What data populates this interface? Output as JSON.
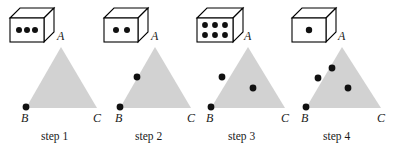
{
  "figure": {
    "background_color": "#ffffff",
    "triangle_fill": "#d2d2d2",
    "dot_color": "#111111",
    "die_face_color": "#ffffff",
    "die_outline_color": "#000000",
    "label_color": "#1a1a1a",
    "width": 398,
    "height": 149
  },
  "panels": [
    {
      "id": "step-1",
      "step_label": "step 1",
      "die": {
        "name": "die-three",
        "pips": 3,
        "pip_layout": "row-3"
      },
      "triangle": {
        "apex_label": "A",
        "left_label": "B",
        "right_label": "C",
        "apex": [
          61,
          47
        ],
        "left": [
          26,
          108
        ],
        "right": [
          97,
          108
        ]
      },
      "points": [
        {
          "name": "point-B",
          "x": 26,
          "y": 107
        }
      ]
    },
    {
      "id": "step-2",
      "step_label": "step 2",
      "die": {
        "name": "die-two",
        "pips": 2,
        "pip_layout": "row-2"
      },
      "triangle": {
        "apex_label": "A",
        "left_label": "B",
        "right_label": "C",
        "apex": [
          155,
          47
        ],
        "left": [
          120,
          108
        ],
        "right": [
          191,
          108
        ]
      },
      "points": [
        {
          "name": "point-B",
          "x": 120,
          "y": 107
        },
        {
          "name": "point-1",
          "x": 137,
          "y": 77
        }
      ]
    },
    {
      "id": "step-3",
      "step_label": "step 3",
      "die": {
        "name": "die-six",
        "pips": 6,
        "pip_layout": "grid-3x2"
      },
      "triangle": {
        "apex_label": "A",
        "left_label": "B",
        "right_label": "C",
        "apex": [
          248,
          47
        ],
        "left": [
          211,
          108
        ],
        "right": [
          285,
          108
        ]
      },
      "points": [
        {
          "name": "point-B",
          "x": 211,
          "y": 107
        },
        {
          "name": "point-1",
          "x": 222,
          "y": 77
        },
        {
          "name": "point-2",
          "x": 253,
          "y": 88
        }
      ]
    },
    {
      "id": "step-4",
      "step_label": "step 4",
      "die": {
        "name": "die-one",
        "pips": 1,
        "pip_layout": "center-1"
      },
      "triangle": {
        "apex_label": "A",
        "left_label": "B",
        "right_label": "C",
        "apex": [
          342,
          47
        ],
        "left": [
          306,
          108
        ],
        "right": [
          381,
          108
        ]
      },
      "points": [
        {
          "name": "point-B",
          "x": 306,
          "y": 107
        },
        {
          "name": "point-1",
          "x": 318,
          "y": 78
        },
        {
          "name": "point-2",
          "x": 332,
          "y": 68
        },
        {
          "name": "point-3",
          "x": 348,
          "y": 88
        }
      ]
    }
  ]
}
